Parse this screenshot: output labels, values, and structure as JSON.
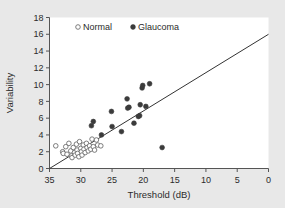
{
  "chart_data": {
    "type": "scatter",
    "title": "",
    "xlabel": "Threshold (dB)",
    "ylabel": "Variability",
    "xlim": [
      35,
      0
    ],
    "ylim": [
      0,
      18
    ],
    "x_reversed": true,
    "xticks": [
      35,
      30,
      25,
      20,
      15,
      10,
      5,
      0
    ],
    "yticks": [
      0,
      2,
      4,
      6,
      8,
      10,
      12,
      14,
      16,
      18
    ],
    "grid": false,
    "legend_position": "top-left-inside",
    "legend": [
      {
        "name": "Normal",
        "marker": "open-circle",
        "color": "#6e6e6e"
      },
      {
        "name": "Glaucoma",
        "marker": "filled-circle",
        "color": "#3b3b3b"
      }
    ],
    "series": [
      {
        "name": "Normal",
        "marker": "open-circle",
        "color": "#6e6e6e",
        "points": [
          [
            34.0,
            2.7
          ],
          [
            32.9,
            2.0
          ],
          [
            32.8,
            1.8
          ],
          [
            32.4,
            2.6
          ],
          [
            32.2,
            1.7
          ],
          [
            31.9,
            3.0
          ],
          [
            31.6,
            2.1
          ],
          [
            31.5,
            1.5
          ],
          [
            31.4,
            1.3
          ],
          [
            31.2,
            2.5
          ],
          [
            31.0,
            1.9
          ],
          [
            30.9,
            1.6
          ],
          [
            30.7,
            2.9
          ],
          [
            30.6,
            2.2
          ],
          [
            30.5,
            1.8
          ],
          [
            30.3,
            1.4
          ],
          [
            30.2,
            3.2
          ],
          [
            30.0,
            2.4
          ],
          [
            29.9,
            2.0
          ],
          [
            29.8,
            1.6
          ],
          [
            29.6,
            2.8
          ],
          [
            29.5,
            2.3
          ],
          [
            29.3,
            1.9
          ],
          [
            29.1,
            3.0
          ],
          [
            29.0,
            2.5
          ],
          [
            28.8,
            2.1
          ],
          [
            28.6,
            2.7
          ],
          [
            28.4,
            2.3
          ],
          [
            28.2,
            3.5
          ],
          [
            28.0,
            2.6
          ],
          [
            27.8,
            2.2
          ],
          [
            27.5,
            3.4
          ],
          [
            27.3,
            2.8
          ],
          [
            26.8,
            2.7
          ]
        ]
      },
      {
        "name": "Glaucoma",
        "marker": "filled-circle",
        "color": "#3b3b3b",
        "points": [
          [
            28.3,
            5.1
          ],
          [
            28.0,
            5.6
          ],
          [
            26.7,
            4.0
          ],
          [
            25.1,
            6.8
          ],
          [
            25.0,
            5.0
          ],
          [
            23.5,
            4.4
          ],
          [
            22.6,
            8.3
          ],
          [
            22.5,
            7.2
          ],
          [
            22.3,
            7.3
          ],
          [
            21.5,
            5.4
          ],
          [
            20.8,
            6.2
          ],
          [
            20.6,
            6.3
          ],
          [
            20.5,
            7.6
          ],
          [
            20.2,
            9.6
          ],
          [
            20.1,
            9.9
          ],
          [
            19.6,
            7.4
          ],
          [
            19.0,
            10.1
          ],
          [
            17.0,
            2.5
          ]
        ]
      }
    ],
    "fit_line": {
      "name": "regression-line",
      "color": "#333333",
      "x_start": 35.0,
      "y_start": 0.0,
      "x_end": 0.0,
      "y_end": 16.0
    }
  }
}
